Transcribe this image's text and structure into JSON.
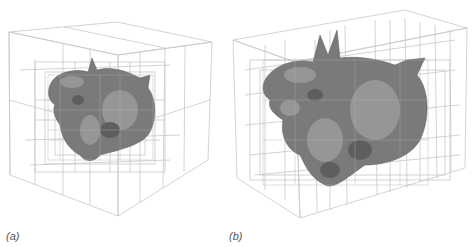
{
  "figure": {
    "panels": [
      {
        "id": "a",
        "caption": "(a)",
        "subject": "dragon-model",
        "structure": "octree-wireframe"
      },
      {
        "id": "b",
        "caption": "(b)",
        "subject": "dragon-model",
        "structure": "kd-tree-wireframe"
      }
    ],
    "colors": {
      "wire": "#c4c4c4",
      "model": "#7d7d7d",
      "background": "#ffffff",
      "caption": "#555555"
    }
  }
}
